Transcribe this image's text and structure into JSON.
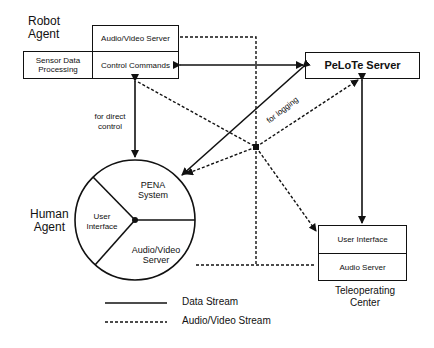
{
  "robot_agent": {
    "title_line1": "Robot",
    "title_line2": "Agent",
    "av_server": "Audio/Video Server",
    "sensor_line1": "Sensor Data",
    "sensor_line2": "Processing",
    "control": "Control Commands"
  },
  "pelote": {
    "label": "PeLoTe Server"
  },
  "human_agent": {
    "title_line1": "Human",
    "title_line2": "Agent",
    "pena_line1": "PENA",
    "pena_line2": "System",
    "ui_line1": "User",
    "ui_line2": "Interface",
    "av_line1": "Audio/Video",
    "av_line2": "Server"
  },
  "teleop": {
    "ui": "User Interface",
    "audio": "Audio Server",
    "title_line1": "Teleoperating",
    "title_line2": "Center"
  },
  "annotations": {
    "direct_line1": "for direct",
    "direct_line2": "control",
    "logging": "for logging"
  },
  "legend": {
    "data": "Data Stream",
    "av": "Audio/Video Stream"
  },
  "colors": {
    "ink": "#111111",
    "background": "#ffffff"
  }
}
